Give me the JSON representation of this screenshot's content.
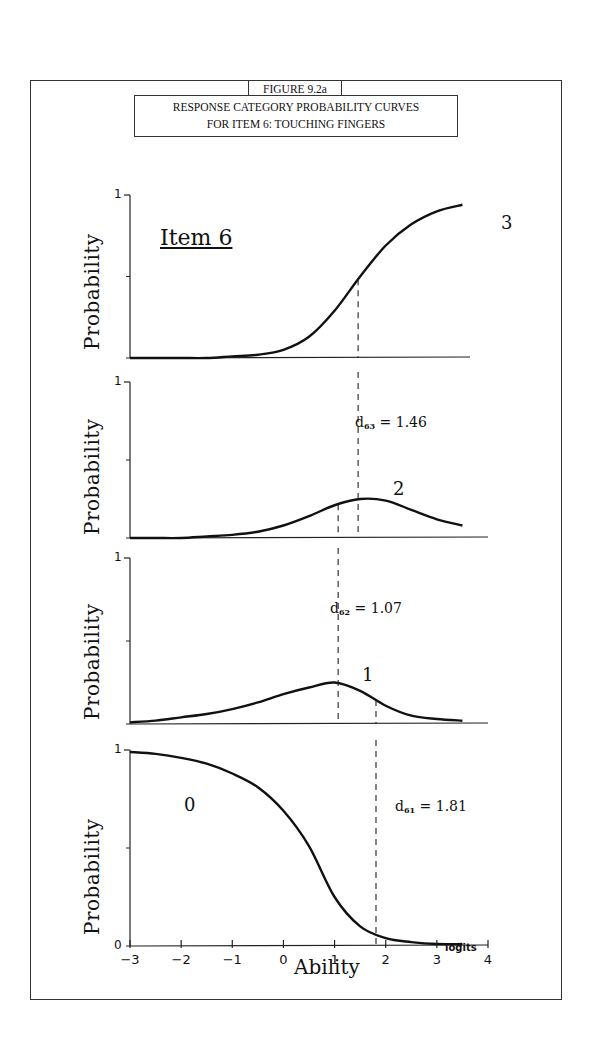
{
  "figure": {
    "label": "FIGURE 9.2a",
    "title_line1": "RESPONSE CATEGORY PROBABILITY CURVES",
    "title_line2": "FOR ITEM 6: TOUCHING FINGERS",
    "item_title": "Item 6"
  },
  "axes": {
    "ylabel": "Probability",
    "xlabel": "Ability",
    "x_unit": "logits",
    "y_one": "1",
    "y_zero": "0",
    "x_ticks": [
      "-3",
      "-2",
      "-1",
      "0",
      "1",
      "2",
      "3",
      "4"
    ]
  },
  "panels": [
    {
      "category": "3",
      "d_label": null
    },
    {
      "category": "2",
      "d_sub": "63",
      "d_value": "1.46",
      "d_prefix": "d",
      "d_eq": "="
    },
    {
      "category": "1",
      "d_sub": "62",
      "d_value": "1.07",
      "d_prefix": "d",
      "d_eq": "="
    },
    {
      "category": "0",
      "d_sub": "61",
      "d_value": "1.81",
      "d_prefix": "d",
      "d_eq": "="
    }
  ],
  "chart_data": {
    "type": "line",
    "subtitle": "Item 6",
    "xlabel": "Ability (logits)",
    "ylabel": "Probability",
    "xlim": [
      -3,
      4
    ],
    "ylim": [
      0,
      1
    ],
    "x_ticks": [
      -3,
      -2,
      -1,
      0,
      1,
      2,
      3,
      4
    ],
    "grid": false,
    "layout": "4 vertically stacked panels, top to bottom: category 3, 2, 1, 0",
    "annotations": [
      {
        "panel": "category 2",
        "text": "d63 = 1.46",
        "x": 1.46
      },
      {
        "panel": "category 1",
        "text": "d62 = 1.07",
        "x": 1.07
      },
      {
        "panel": "category 0",
        "text": "d61 = 1.81",
        "x": 1.81
      }
    ],
    "x": [
      -3,
      -2.5,
      -2,
      -1.5,
      -1,
      -0.5,
      0,
      0.5,
      1,
      1.5,
      2,
      2.5,
      3,
      3.5
    ],
    "series": [
      {
        "name": "Category 3",
        "values": [
          0.0,
          0.0,
          0.0,
          0.0,
          0.01,
          0.02,
          0.05,
          0.13,
          0.29,
          0.5,
          0.69,
          0.82,
          0.9,
          0.94
        ]
      },
      {
        "name": "Category 2",
        "values": [
          0.0,
          0.0,
          0.0,
          0.01,
          0.02,
          0.04,
          0.08,
          0.14,
          0.21,
          0.25,
          0.24,
          0.18,
          0.12,
          0.08
        ]
      },
      {
        "name": "Category 1",
        "values": [
          0.01,
          0.02,
          0.04,
          0.06,
          0.09,
          0.13,
          0.18,
          0.22,
          0.25,
          0.2,
          0.11,
          0.05,
          0.03,
          0.02
        ]
      },
      {
        "name": "Category 0",
        "values": [
          0.99,
          0.98,
          0.96,
          0.93,
          0.88,
          0.81,
          0.69,
          0.51,
          0.25,
          0.1,
          0.04,
          0.02,
          0.01,
          0.01
        ]
      }
    ],
    "dashed_markers": [
      {
        "panel": "category 3",
        "x": [
          1.46
        ]
      },
      {
        "panel": "category 2",
        "x": [
          1.07,
          1.46
        ]
      },
      {
        "panel": "category 1",
        "x": [
          1.07,
          1.81
        ]
      },
      {
        "panel": "category 0",
        "x": [
          1.81
        ]
      }
    ]
  }
}
